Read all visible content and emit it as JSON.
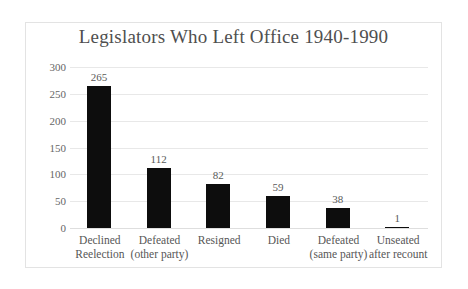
{
  "chart_data": {
    "type": "bar",
    "title": "Legislators Who Left Office 1940-1990",
    "xlabel": "",
    "ylabel": "",
    "ylim": [
      0,
      300
    ],
    "yticks": [
      "0",
      "50",
      "100",
      "150",
      "200",
      "250",
      "300"
    ],
    "grid": true,
    "legend": "none",
    "bar_color": "#0d0d0d",
    "categories": [
      "Declined Reelection",
      "Defeated (other party)",
      "Resigned",
      "Died",
      "Defeated (same party)",
      "Unseated after recount"
    ],
    "category_lines": [
      {
        "line1": "Declined",
        "line2": "Reelection"
      },
      {
        "line1": "Defeated",
        "line2": "(other party)"
      },
      {
        "line1": "Resigned",
        "line2": ""
      },
      {
        "line1": "Died",
        "line2": ""
      },
      {
        "line1": "Defeated",
        "line2": "(same party)"
      },
      {
        "line1": "Unseated",
        "line2": "after recount"
      }
    ],
    "values": [
      265,
      112,
      82,
      59,
      38,
      1
    ],
    "value_labels": [
      "265",
      "112",
      "82",
      "59",
      "38",
      "1"
    ]
  }
}
